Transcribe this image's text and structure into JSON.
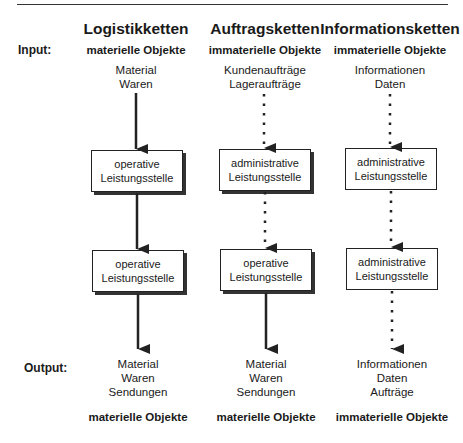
{
  "row_labels": {
    "input": "Input:",
    "output": "Output:"
  },
  "columns": [
    {
      "title": "Logistikketten",
      "input_category": "materielle Objekte",
      "input_items": [
        "Material",
        "Waren"
      ],
      "boxes": [
        {
          "line1": "operative",
          "line2": "Leistungsstelle"
        },
        {
          "line1": "operative",
          "line2": "Leistungsstelle"
        }
      ],
      "arrow_styles": [
        "solid",
        "solid",
        "solid"
      ],
      "output_items": [
        "Material",
        "Waren",
        "Sendungen"
      ],
      "output_category": "materielle Objekte"
    },
    {
      "title": "Auftragsketten",
      "input_category": "immaterielle Objekte",
      "input_items": [
        "Kundenaufträge",
        "Lageraufträge"
      ],
      "boxes": [
        {
          "line1": "administrative",
          "line2": "Leistungsstelle"
        },
        {
          "line1": "operative",
          "line2": "Leistungsstelle"
        }
      ],
      "arrow_styles": [
        "dotted",
        "dotted",
        "solid"
      ],
      "output_items": [
        "Material",
        "Waren",
        "Sendungen"
      ],
      "output_category": "materielle Objekte"
    },
    {
      "title": "Informationsketten",
      "input_category": "immaterielle Objekte",
      "input_items": [
        "Informationen",
        "Daten"
      ],
      "boxes": [
        {
          "line1": "administrative",
          "line2": "Leistungsstelle"
        },
        {
          "line1": "administrative",
          "line2": "Leistungsstelle"
        }
      ],
      "arrow_styles": [
        "dotted",
        "dotted",
        "dotted"
      ],
      "output_items": [
        "Informationen",
        "Daten",
        "Aufträge"
      ],
      "output_category": "immaterielle Objekte"
    }
  ]
}
